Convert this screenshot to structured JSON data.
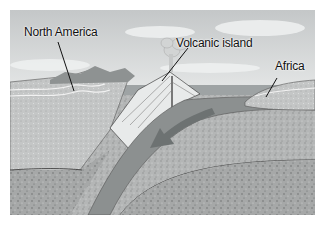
{
  "diagram": {
    "labels": {
      "north_america": "North America",
      "volcanic_island": "Volcanic island",
      "africa": "Africa"
    },
    "elements": [
      "sky",
      "clouds",
      "ocean",
      "continental-crust-north-america",
      "volcano",
      "eruption-plume",
      "subducting-oceanic-plate",
      "africa-continent",
      "mantle",
      "plate-motion-arrow"
    ],
    "colors": {
      "sky": "#cfd2d3",
      "ocean": "#9ea3a4",
      "crust": "#b5b8b8",
      "mantle": "#a9abab",
      "plate": "#8c9090",
      "arrow": "#6d7272",
      "line": "#1a1a1a"
    }
  }
}
